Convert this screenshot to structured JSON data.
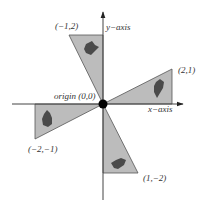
{
  "diagram": {
    "type": "coordinate-plane-rotations",
    "origin_label": "origin (0,0)",
    "x_axis_label": "x−axis",
    "y_axis_label": "y−axis",
    "colors": {
      "triangle_fill": "#bcbcbc",
      "triangle_stroke": "#555555",
      "axis": "#444444",
      "turtle": "#4a4a4a",
      "origin_dot": "#000000"
    },
    "triangles": [
      {
        "label": "(−1,2)",
        "vertex": [
          -1,
          2
        ],
        "axis_point": [
          0,
          2
        ]
      },
      {
        "label": "(2,1)",
        "vertex": [
          2,
          1
        ],
        "axis_point": [
          2,
          0
        ]
      },
      {
        "label": "(−2,−1)",
        "vertex": [
          -2,
          -1
        ],
        "axis_point": [
          -2,
          0
        ]
      },
      {
        "label": "(1,−2)",
        "vertex": [
          1,
          -2
        ],
        "axis_point": [
          0,
          -2
        ]
      }
    ]
  }
}
